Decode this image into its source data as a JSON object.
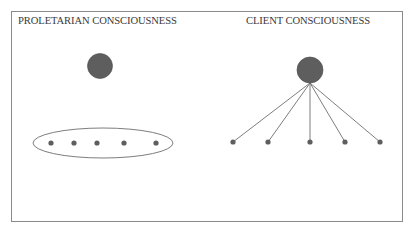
{
  "left_panel": {
    "title": "PROLETARIAN CONSCIOUSNESS",
    "central_node": {
      "cx": 100,
      "cy": 66,
      "r": 12.5
    },
    "group_ellipse": {
      "cx": 103,
      "cy": 143,
      "rx": 70,
      "ry": 15
    },
    "member_nodes": [
      {
        "cx": 51,
        "cy": 143
      },
      {
        "cx": 74,
        "cy": 143
      },
      {
        "cx": 97,
        "cy": 143
      },
      {
        "cx": 124,
        "cy": 143
      },
      {
        "cx": 156,
        "cy": 143
      }
    ]
  },
  "right_panel": {
    "title": "CLIENT CONSCIOUSNESS",
    "central_node": {
      "cx": 310,
      "cy": 70,
      "r": 13
    },
    "hub_point": {
      "x": 310,
      "y": 83
    },
    "member_nodes": [
      {
        "cx": 233,
        "cy": 142
      },
      {
        "cx": 268,
        "cy": 142
      },
      {
        "cx": 310,
        "cy": 142
      },
      {
        "cx": 345,
        "cy": 142
      },
      {
        "cx": 380,
        "cy": 142
      }
    ]
  },
  "colors": {
    "node_fill": "#5e5e5e",
    "node_stroke": "#4a4a4a",
    "line": "#6e6e6e",
    "frame": "#8a8a8a",
    "text": "#3a3a3a"
  }
}
